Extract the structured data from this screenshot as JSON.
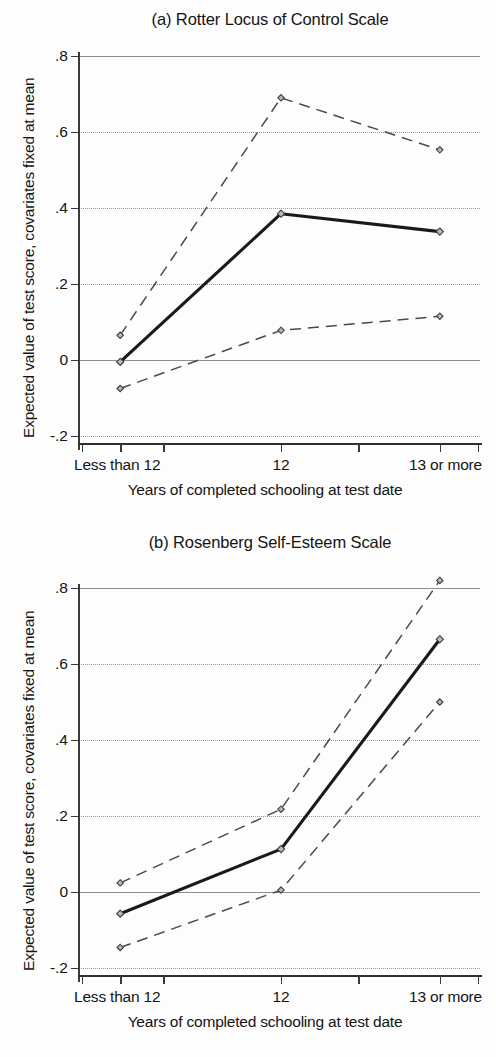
{
  "figure": {
    "shared_ylabel": "Expected value of test score, covariates fixed at mean",
    "shared_xlabel": "Years of completed schooling at test date",
    "categories": [
      "Less than 12",
      "12",
      "13 or more"
    ],
    "ytick_labels": [
      ".8",
      ".6",
      ".4",
      ".2",
      "0",
      "-.2"
    ],
    "ytick_values": [
      0.8,
      0.6,
      0.4,
      0.2,
      0,
      -0.2
    ],
    "colors": {
      "axis": "#2e2e2e",
      "grid": "#8e8e8e",
      "point_estimate": "#1a1a1a",
      "confidence_band": "#4a4a4a",
      "marker_fill": "#b9b9b9"
    }
  },
  "chart_data": [
    {
      "type": "line",
      "panel": "a",
      "title": "(a) Rotter Locus of Control Scale",
      "xlabel": "Years of completed schooling at test date",
      "ylabel": "Expected value of test score, covariates fixed at mean",
      "categories": [
        "Less than 12",
        "12",
        "13 or more"
      ],
      "ylim": [
        -0.2,
        0.8
      ],
      "yticks": [
        -0.2,
        0,
        0.2,
        0.4,
        0.6,
        0.8
      ],
      "grid": true,
      "legend": "none",
      "series": [
        {
          "name": "Upper 95% confidence limit",
          "style": "dashed",
          "values": [
            0.065,
            0.69,
            0.553
          ]
        },
        {
          "name": "Expected value (point estimate)",
          "style": "solid",
          "values": [
            -0.005,
            0.385,
            0.338
          ]
        },
        {
          "name": "Lower 95% confidence limit",
          "style": "dashed",
          "values": [
            -0.075,
            0.078,
            0.115
          ]
        }
      ]
    },
    {
      "type": "line",
      "panel": "b",
      "title": "(b) Rosenberg Self-Esteem Scale",
      "xlabel": "Years of completed schooling at test date",
      "ylabel": "Expected value of test score, covariates fixed at mean",
      "categories": [
        "Less than 12",
        "12",
        "13 or more"
      ],
      "ylim": [
        -0.2,
        0.8
      ],
      "yticks": [
        -0.2,
        0,
        0.2,
        0.4,
        0.6,
        0.8
      ],
      "grid": true,
      "legend": "none",
      "series": [
        {
          "name": "Upper 95% confidence limit",
          "style": "dashed",
          "values": [
            0.024,
            0.218,
            0.82
          ]
        },
        {
          "name": "Expected value (point estimate)",
          "style": "solid",
          "values": [
            -0.057,
            0.113,
            0.665
          ]
        },
        {
          "name": "Lower 95% confidence limit",
          "style": "dashed",
          "values": [
            -0.146,
            0.005,
            0.5
          ]
        }
      ]
    }
  ]
}
